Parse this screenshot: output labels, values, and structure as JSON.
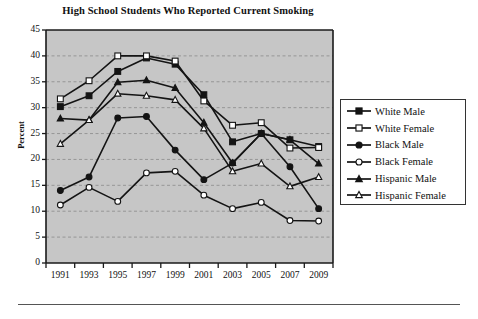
{
  "chart_data": {
    "type": "line",
    "title": "High School Students Who Reported Current Smoking",
    "xlabel": "",
    "ylabel": "Percent",
    "categories": [
      "1991",
      "1993",
      "1995",
      "1997",
      "1999",
      "2001",
      "2003",
      "2005",
      "2007",
      "2009"
    ],
    "x": [
      1991,
      1993,
      1995,
      1997,
      1999,
      2001,
      2003,
      2005,
      2007,
      2009
    ],
    "ylim": [
      0,
      45
    ],
    "yticks": [
      0,
      5,
      10,
      15,
      20,
      25,
      30,
      35,
      40,
      45
    ],
    "grid": true,
    "grid_axis": "y",
    "legend_position": "right",
    "series": [
      {
        "name": "White Male",
        "marker": "filled-square",
        "values": [
          30.2,
          32.3,
          37.0,
          39.6,
          38.4,
          32.5,
          23.4,
          25.0,
          23.8,
          22.5
        ]
      },
      {
        "name": "White Female",
        "marker": "open-square",
        "values": [
          31.7,
          35.2,
          40.0,
          40.0,
          39.0,
          31.3,
          26.6,
          27.1,
          22.2,
          22.3
        ]
      },
      {
        "name": "Black Male",
        "marker": "filled-circle",
        "values": [
          14.0,
          16.6,
          28.0,
          28.3,
          21.8,
          16.1,
          19.3,
          25.0,
          18.6,
          10.5
        ]
      },
      {
        "name": "Black Female",
        "marker": "open-circle",
        "values": [
          11.2,
          14.6,
          11.9,
          17.4,
          17.7,
          13.1,
          10.5,
          11.7,
          8.2,
          8.1
        ]
      },
      {
        "name": "Hispanic Male",
        "marker": "filled-triangle",
        "values": [
          27.9,
          27.6,
          34.9,
          35.3,
          33.8,
          27.1,
          19.3,
          25.0,
          23.8,
          19.2
        ]
      },
      {
        "name": "Hispanic Female",
        "marker": "open-triangle",
        "values": [
          23.0,
          27.6,
          32.7,
          32.3,
          31.5,
          26.0,
          17.7,
          19.2,
          14.8,
          16.6
        ]
      }
    ]
  },
  "axes": {
    "y_tick_labels": [
      "45",
      "40",
      "35",
      "30",
      "25",
      "20",
      "15",
      "10",
      "5",
      "0"
    ],
    "x_tick_labels": [
      "1991",
      "1993",
      "1995",
      "1997",
      "1999",
      "2001",
      "2003",
      "2005",
      "2007",
      "2009"
    ],
    "ylabel": "Percent"
  },
  "legend": {
    "entries": [
      {
        "label": "White Male",
        "marker": "filled-square"
      },
      {
        "label": "White Female",
        "marker": "open-square"
      },
      {
        "label": "Black Male",
        "marker": "filled-circle"
      },
      {
        "label": "Black Female",
        "marker": "open-circle"
      },
      {
        "label": "Hispanic Male",
        "marker": "filled-triangle"
      },
      {
        "label": "Hispanic Female",
        "marker": "open-triangle"
      }
    ]
  },
  "colors": {
    "plot_background": "#c6c6c6",
    "line": "#141414",
    "text": "#111111",
    "grid": "#8a8a8a",
    "axis": "#1a1a1a",
    "legend_border": "#333333",
    "rule": "#555555"
  }
}
